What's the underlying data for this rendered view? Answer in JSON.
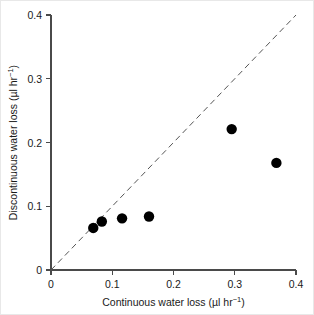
{
  "chart_data": {
    "type": "scatter",
    "title": "",
    "xlabel": "Continuous water loss (µl hr⁻¹)",
    "ylabel": "Discontinuous water loss (µl hr⁻¹)",
    "xlabel_parts": {
      "main": "Continuous water loss (µl hr",
      "superscript": "−1",
      "tail": ")"
    },
    "ylabel_parts": {
      "main": "Discontinuous water loss (µl hr",
      "superscript": "−1",
      "tail": ")"
    },
    "xlim": [
      0,
      0.4
    ],
    "ylim": [
      0,
      0.4
    ],
    "xticks": [
      0,
      0.1,
      0.2,
      0.3,
      0.4
    ],
    "yticks": [
      0,
      0.1,
      0.2,
      0.3,
      0.4
    ],
    "xtick_labels": [
      "0",
      "0.1",
      "0.2",
      "0.3",
      "0.4"
    ],
    "ytick_labels": [
      "0",
      "0.1",
      "0.2",
      "0.3",
      "0.4"
    ],
    "grid": false,
    "legend": false,
    "marker": "filled-circle",
    "marker_color": "#000000",
    "marker_size_px": 5.2,
    "points": [
      {
        "x": 0.069,
        "y": 0.066
      },
      {
        "x": 0.083,
        "y": 0.076
      },
      {
        "x": 0.116,
        "y": 0.081
      },
      {
        "x": 0.16,
        "y": 0.084
      },
      {
        "x": 0.295,
        "y": 0.221
      },
      {
        "x": 0.368,
        "y": 0.168
      }
    ],
    "reference_line": {
      "name": "identity-line",
      "style": "dashed",
      "color": "#555555",
      "from": [
        0,
        0
      ],
      "to": [
        0.4,
        0.4
      ],
      "slope": 1,
      "intercept": 0
    }
  },
  "axis_colors": {
    "axis": "#4a4a4a",
    "text": "#1a1a1a",
    "background": "#ffffff"
  }
}
